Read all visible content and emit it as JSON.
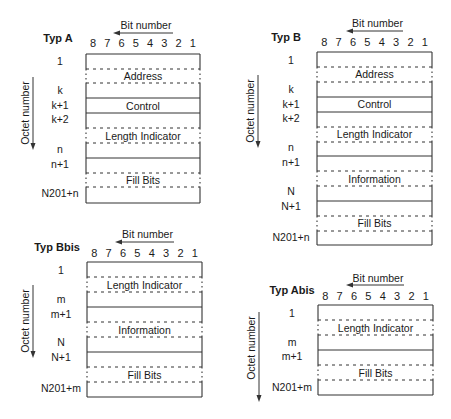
{
  "colors": {
    "line": "#333333",
    "text": "#1a1a1a",
    "background": "#ffffff"
  },
  "common": {
    "bit_axis_label": "Bit number",
    "octet_axis_label": "Octet number",
    "bit_digits": [
      "8",
      "7",
      "6",
      "5",
      "4",
      "3",
      "2",
      "1"
    ]
  },
  "panels": [
    {
      "id": "typ-a",
      "title": "Typ A",
      "origin": {
        "box_left": 86,
        "box_right": 200,
        "box_top": 54
      },
      "bit_header": {
        "text_y": 29,
        "arrow_y": 33,
        "arrow_x1": 113,
        "arrow_x2": 173,
        "digits_y": 47
      },
      "octet_arrow": {
        "x": 33,
        "y1": 77,
        "y2": 150
      },
      "title_pos": {
        "x": 58,
        "y": 42
      },
      "octet_labels": [
        {
          "text": "1",
          "y": 65
        },
        {
          "text": "k",
          "y": 94
        },
        {
          "text": "k+1",
          "y": 109
        },
        {
          "text": "k+2",
          "y": 123
        },
        {
          "text": "n",
          "y": 153
        },
        {
          "text": "n+1",
          "y": 168
        },
        {
          "text": "N201+n",
          "y": 197
        }
      ],
      "lines": [
        {
          "y": 69,
          "style": "dashed"
        },
        {
          "y": 83,
          "style": "dashed"
        },
        {
          "y": 98,
          "style": "solid"
        },
        {
          "y": 113,
          "style": "solid"
        },
        {
          "y": 128,
          "style": "dashed"
        },
        {
          "y": 143,
          "style": "dashed"
        },
        {
          "y": 158,
          "style": "solid"
        },
        {
          "y": 173,
          "style": "dashed"
        },
        {
          "y": 187,
          "style": "dashed"
        }
      ],
      "box_bottom": 203,
      "fields": [
        {
          "label": "Address",
          "y": 80
        },
        {
          "label": "Control",
          "y": 110
        },
        {
          "label": "Length Indicator",
          "y": 140
        },
        {
          "label": "Fill Bits",
          "y": 184
        }
      ]
    },
    {
      "id": "typ-b",
      "title": "Typ B",
      "origin": {
        "box_left": 317,
        "box_right": 432,
        "box_top": 52
      },
      "bit_header": {
        "text_y": 27,
        "arrow_y": 31,
        "arrow_x1": 346,
        "arrow_x2": 403,
        "digits_y": 46
      },
      "octet_arrow": {
        "x": 258,
        "y1": 75,
        "y2": 148
      },
      "title_pos": {
        "x": 286,
        "y": 41
      },
      "octet_labels": [
        {
          "text": "1",
          "y": 64
        },
        {
          "text": "k",
          "y": 93
        },
        {
          "text": "k+1",
          "y": 108
        },
        {
          "text": "k+2",
          "y": 122
        },
        {
          "text": "n",
          "y": 151
        },
        {
          "text": "n+1",
          "y": 166
        },
        {
          "text": "N",
          "y": 195
        },
        {
          "text": "N+1",
          "y": 210
        },
        {
          "text": "N201+n",
          "y": 241
        }
      ],
      "lines": [
        {
          "y": 67,
          "style": "dashed"
        },
        {
          "y": 82,
          "style": "dashed"
        },
        {
          "y": 97,
          "style": "solid"
        },
        {
          "y": 112,
          "style": "solid"
        },
        {
          "y": 127,
          "style": "dashed"
        },
        {
          "y": 142,
          "style": "dashed"
        },
        {
          "y": 156,
          "style": "solid"
        },
        {
          "y": 171,
          "style": "dashed"
        },
        {
          "y": 186,
          "style": "dashed"
        },
        {
          "y": 201,
          "style": "solid"
        },
        {
          "y": 216,
          "style": "dashed"
        },
        {
          "y": 231,
          "style": "dashed"
        }
      ],
      "box_bottom": 245,
      "fields": [
        {
          "label": "Address",
          "y": 78
        },
        {
          "label": "Control",
          "y": 108
        },
        {
          "label": "Length Indicator",
          "y": 138
        },
        {
          "label": "Information",
          "y": 183
        },
        {
          "label": "Fill Bits",
          "y": 227
        }
      ]
    },
    {
      "id": "typ-bbis",
      "title": "Typ Bbis",
      "origin": {
        "box_left": 87,
        "box_right": 202,
        "box_top": 262
      },
      "bit_header": {
        "text_y": 238,
        "arrow_y": 242,
        "arrow_x1": 115,
        "arrow_x2": 174,
        "digits_y": 257
      },
      "octet_arrow": {
        "x": 33,
        "y1": 285,
        "y2": 358
      },
      "title_pos": {
        "x": 57,
        "y": 251
      },
      "octet_labels": [
        {
          "text": "1",
          "y": 274
        },
        {
          "text": "m",
          "y": 303
        },
        {
          "text": "m+1",
          "y": 318
        },
        {
          "text": "N",
          "y": 346
        },
        {
          "text": "N+1",
          "y": 361
        },
        {
          "text": "N201+m",
          "y": 392
        }
      ],
      "lines": [
        {
          "y": 277,
          "style": "dashed"
        },
        {
          "y": 292,
          "style": "dashed"
        },
        {
          "y": 307,
          "style": "solid"
        },
        {
          "y": 322,
          "style": "dashed"
        },
        {
          "y": 337,
          "style": "dashed"
        },
        {
          "y": 352,
          "style": "solid"
        },
        {
          "y": 367,
          "style": "dashed"
        },
        {
          "y": 382,
          "style": "dashed"
        }
      ],
      "box_bottom": 397,
      "fields": [
        {
          "label": "Length Indicator",
          "y": 289
        },
        {
          "label": "Information",
          "y": 334
        },
        {
          "label": "Fill Bits",
          "y": 379
        }
      ]
    },
    {
      "id": "typ-abis",
      "title": "Typ Abis",
      "origin": {
        "box_left": 318,
        "box_right": 433,
        "box_top": 305
      },
      "bit_header": {
        "text_y": 282,
        "arrow_y": 285,
        "arrow_x1": 346,
        "arrow_x2": 404,
        "digits_y": 300
      },
      "octet_arrow": {
        "x": 259,
        "y1": 312,
        "y2": 402
      },
      "title_pos": {
        "x": 292,
        "y": 294
      },
      "octet_labels": [
        {
          "text": "1",
          "y": 317
        },
        {
          "text": "m",
          "y": 346
        },
        {
          "text": "m+1",
          "y": 360
        },
        {
          "text": "N201+m",
          "y": 391
        }
      ],
      "lines": [
        {
          "y": 320,
          "style": "dashed"
        },
        {
          "y": 335,
          "style": "dashed"
        },
        {
          "y": 350,
          "style": "solid"
        },
        {
          "y": 365,
          "style": "dashed"
        },
        {
          "y": 380,
          "style": "dashed"
        }
      ],
      "box_bottom": 395,
      "fields": [
        {
          "label": "Length Indicator",
          "y": 332
        },
        {
          "label": "Fill Bits",
          "y": 377
        }
      ]
    }
  ]
}
